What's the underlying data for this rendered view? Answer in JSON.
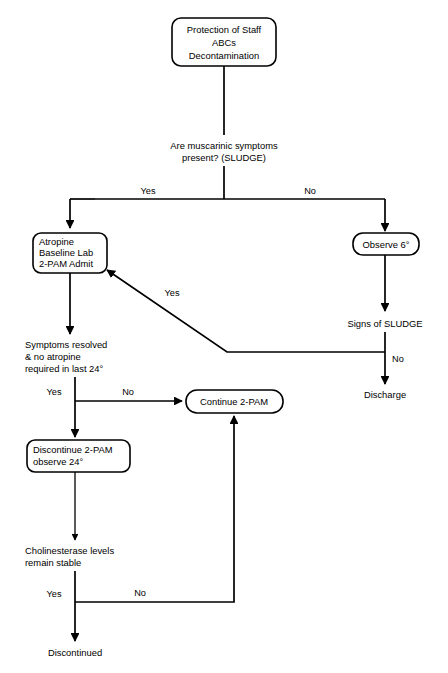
{
  "diagram": {
    "colors": {
      "background": "#ffffff",
      "stroke": "#000000",
      "text": "#000000"
    },
    "nodes": {
      "start": {
        "lines": [
          "Protection of Staff",
          "ABCs",
          "Decontamination"
        ],
        "shape": "rounded-box"
      },
      "muscarinic_question": {
        "lines": [
          "Are muscarinic symptoms",
          "present? (SLUDGE)"
        ],
        "shape": "plain-text"
      },
      "atropine": {
        "lines": [
          "Atropine",
          "Baseline Lab",
          "2-PAM Admit"
        ],
        "shape": "rounded-box"
      },
      "observe6": {
        "lines": [
          "Observe 6°"
        ],
        "shape": "rounded-box"
      },
      "signs_of_sludge": {
        "lines": [
          "Signs of SLUDGE"
        ],
        "shape": "plain-text"
      },
      "discharge": {
        "lines": [
          "Discharge"
        ],
        "shape": "plain-text"
      },
      "symptoms_resolved": {
        "lines": [
          "Symptoms resolved",
          "& no atropine",
          "required in last 24°"
        ],
        "shape": "plain-text"
      },
      "continue_2pam": {
        "lines": [
          "Continue 2-PAM"
        ],
        "shape": "rounded-box"
      },
      "discontinue_2pam": {
        "lines": [
          "Discontinue 2-PAM",
          "observe 24°"
        ],
        "shape": "rounded-box"
      },
      "cholinesterase": {
        "lines": [
          "Cholinesterase levels",
          "remain stable"
        ],
        "shape": "plain-text"
      },
      "discontinued": {
        "lines": [
          "Discontinued"
        ],
        "shape": "plain-text"
      }
    },
    "branch_labels": {
      "muscarinic_yes": "Yes",
      "muscarinic_no": "No",
      "sludge_yes": "Yes",
      "sludge_no": "No",
      "resolved_yes": "Yes",
      "resolved_no": "No",
      "cholinesterase_yes": "Yes",
      "cholinesterase_no": "No"
    }
  }
}
